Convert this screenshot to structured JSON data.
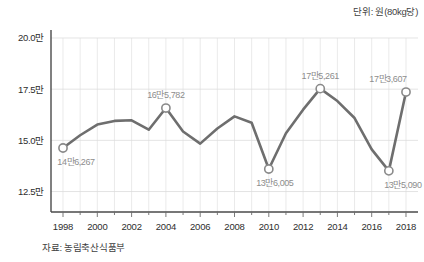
{
  "unit_note": "단위: 원(80kg당)",
  "source_note": "자료: 농림축산식품부",
  "chart_data": {
    "type": "line",
    "title": "",
    "subtitle": "",
    "xlabel": "",
    "ylabel": "",
    "unit": "단위: 원(80kg당)",
    "source": "자료: 농림축산식품부",
    "grid": true,
    "legend": false,
    "xlim": [
      1997.3,
      2018.7
    ],
    "ylim": [
      115000,
      200000
    ],
    "ytick_labels": [
      "20.0만",
      "17.5만",
      "15.0만",
      "12.5만"
    ],
    "ytick_values": [
      200000,
      175000,
      150000,
      125000
    ],
    "xtick_labels": [
      "1998",
      "2000",
      "2002",
      "2004",
      "2006",
      "2008",
      "2010",
      "2012",
      "2014",
      "2016",
      "2018"
    ],
    "xtick_values": [
      1998,
      2000,
      2002,
      2004,
      2006,
      2008,
      2010,
      2012,
      2014,
      2016,
      2018
    ],
    "x": [
      1998,
      1999,
      2000,
      2001,
      2002,
      2003,
      2004,
      2005,
      2006,
      2007,
      2008,
      2009,
      2010,
      2011,
      2012,
      2013,
      2014,
      2015,
      2016,
      2017,
      2018
    ],
    "values": [
      146267,
      152500,
      157700,
      159500,
      159800,
      155200,
      165782,
      154300,
      148400,
      155800,
      161700,
      158600,
      136005,
      153500,
      165000,
      175261,
      169200,
      160900,
      145600,
      135090,
      173607
    ],
    "point_labels": [
      {
        "x": 1998,
        "value": 146267,
        "text": "14만6,267",
        "position": "below"
      },
      {
        "x": 2004,
        "value": 165782,
        "text": "16만5,782",
        "position": "above"
      },
      {
        "x": 2010,
        "value": 136005,
        "text": "13만6,005",
        "position": "below"
      },
      {
        "x": 2013,
        "value": 175261,
        "text": "17만5,261",
        "position": "above"
      },
      {
        "x": 2017,
        "value": 135090,
        "text": "13만5,090",
        "position": "below"
      },
      {
        "x": 2018,
        "value": 173607,
        "text": "17만3,607",
        "position": "above"
      }
    ],
    "marked_points": [
      1998,
      2004,
      2010,
      2013,
      2017,
      2018
    ],
    "colors": {
      "line": "#6e6e6e",
      "marker_fill": "#ffffff",
      "marker_stroke": "#8a8a8a",
      "grid": "#d8d8d8",
      "axis": "#4a4a4a",
      "label_text": "#8d8d8d",
      "tick_text": "#2e2e2e"
    }
  }
}
